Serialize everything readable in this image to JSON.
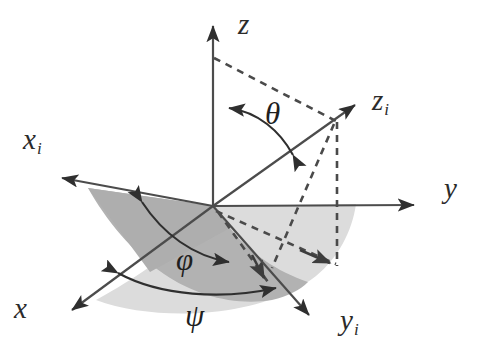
{
  "figure": {
    "background_color": "#ffffff",
    "stroke_color": "#3a3a3a",
    "dashed_color": "#4a4a4a",
    "dark_plane_color": "#b3b3b3",
    "light_plane_color": "#d9d9d9"
  },
  "axes": [
    {
      "id": "z",
      "label": "z",
      "subscript": "",
      "label_x": 238,
      "label_y": 14,
      "description": "vertical fixed axis pointing up"
    },
    {
      "id": "y",
      "label": "y",
      "subscript": "",
      "label_x": 444,
      "label_y": 178,
      "description": "horizontal fixed axis pointing right"
    },
    {
      "id": "x",
      "label": "x",
      "subscript": "",
      "label_x": 14,
      "label_y": 297,
      "description": "fixed axis pointing down-left toward viewer"
    },
    {
      "id": "z_i",
      "label": "z",
      "subscript": "i",
      "label_x": 372,
      "label_y": 90,
      "description": "rotated body axis pointing up-right"
    },
    {
      "id": "x_i",
      "label": "x",
      "subscript": "i",
      "label_x": 23,
      "label_y": 129,
      "description": "rotated body axis pointing up-left"
    },
    {
      "id": "y_i",
      "label": "y",
      "subscript": "i",
      "label_x": 340,
      "label_y": 310,
      "description": "rotated body axis pointing down-right"
    }
  ],
  "angles": [
    {
      "id": "theta",
      "label": "θ",
      "label_x": 265,
      "label_y": 101,
      "description": "nutation angle between z and z_i, double-headed arc"
    },
    {
      "id": "phi",
      "label": "φ",
      "label_x": 176,
      "label_y": 247,
      "description": "precession angle arc in the tilted plane, double-headed"
    },
    {
      "id": "psi",
      "label": "ψ",
      "label_x": 185,
      "label_y": 302,
      "description": "spin angle arc in the base plane, double-headed"
    }
  ],
  "planes": [
    {
      "id": "tilted-plane",
      "name": "x_i y_i rotated plane",
      "fill": "#b3b3b3"
    },
    {
      "id": "base-plane",
      "name": "x y reference plane",
      "fill": "#d9d9d9"
    }
  ],
  "origin": {
    "x": 213,
    "y": 206
  }
}
